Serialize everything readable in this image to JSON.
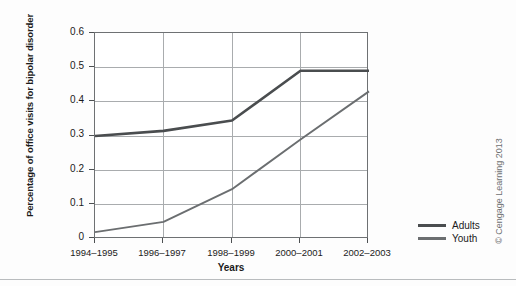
{
  "chart_data": {
    "type": "line",
    "title": "",
    "xlabel": "Years",
    "ylabel": "Percentage of office visits for bipolar disorder",
    "categories": [
      "1994–1995",
      "1996–1997",
      "1998–1999",
      "2000–2001",
      "2002–2003"
    ],
    "series": [
      {
        "name": "Adults",
        "values": [
          0.3,
          0.315,
          0.345,
          0.49,
          0.49
        ],
        "color": "#4a4d4f"
      },
      {
        "name": "Youth",
        "values": [
          0.02,
          0.05,
          0.145,
          0.29,
          0.43
        ],
        "color": "#6b6e70"
      }
    ],
    "ylim": [
      0,
      0.6
    ],
    "yticks": [
      "0",
      "0.1",
      "0.2",
      "0.3",
      "0.4",
      "0.5",
      "0.6"
    ],
    "ytick_values": [
      0,
      0.1,
      0.2,
      0.3,
      0.4,
      0.5,
      0.6
    ],
    "grid": true,
    "legend_position": "right"
  },
  "legend": {
    "entries": [
      {
        "label": "Adults"
      },
      {
        "label": "Youth"
      }
    ]
  },
  "credit": {
    "text": "© Cengage Learning 2013"
  },
  "colors": {
    "adults": "#4a4d4f",
    "youth": "#6b6e70",
    "grid": "#a9acae",
    "frame": "#6e7173",
    "text": "#1b1b1b"
  }
}
